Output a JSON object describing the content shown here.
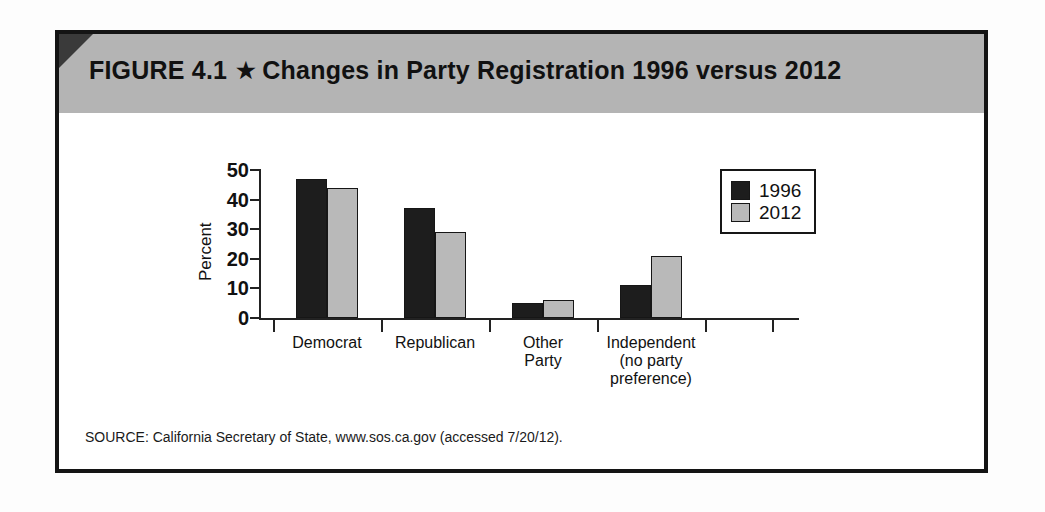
{
  "figure": {
    "label": "FIGURE 4.1",
    "star_icon": "★",
    "title": "Changes in Party Registration 1996 versus 2012",
    "source": "SOURCE: California Secretary of State, www.sos.ca.gov (accessed 7/20/12)."
  },
  "colors": {
    "header_band": "#b4b4b4",
    "corner": "#3a3a3a",
    "series_1996": "#1d1d1d",
    "series_2012": "#b9b9b9",
    "frame": "#141414"
  },
  "chart_data": {
    "type": "bar",
    "title": "Changes in Party Registration 1996 versus 2012",
    "xlabel": "",
    "ylabel": "Percent",
    "ylim": [
      0,
      50
    ],
    "yticks": [
      0,
      10,
      20,
      30,
      40,
      50
    ],
    "ytick_labels": [
      "0",
      "10",
      "20",
      "30",
      "40",
      "50"
    ],
    "grid": false,
    "legend_position": "upper right",
    "categories": [
      "Democrat",
      "Republican",
      "Other Party",
      "Independent (no party preference)"
    ],
    "category_lines": [
      [
        "Democrat"
      ],
      [
        "Republican"
      ],
      [
        "Other",
        "Party"
      ],
      [
        "Independent",
        "(no party",
        "preference)"
      ]
    ],
    "series": [
      {
        "name": "1996",
        "values": [
          47,
          37,
          5,
          11
        ]
      },
      {
        "name": "2012",
        "values": [
          44,
          29,
          6,
          21
        ]
      }
    ]
  }
}
